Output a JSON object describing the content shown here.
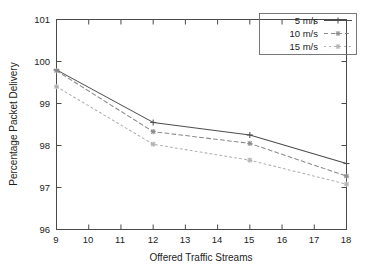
{
  "chart_data": {
    "type": "line",
    "title": "",
    "xlabel": "Offered Traffic Streams",
    "ylabel": "Percentage Packet Delivery",
    "x": [
      9,
      12,
      15,
      18
    ],
    "xlim": [
      9,
      18
    ],
    "ylim": [
      96,
      101
    ],
    "xticks": [
      "9",
      "10",
      "11",
      "12",
      "13",
      "14",
      "15",
      "16",
      "17",
      "18"
    ],
    "yticks": [
      "96",
      "97",
      "98",
      "99",
      "100",
      "101"
    ],
    "grid": false,
    "legend_position": "top-right",
    "series": [
      {
        "name": "5 m/s",
        "values": [
          99.8,
          98.55,
          98.25,
          97.57
        ],
        "color": "#4d4d4d",
        "dash": "none",
        "marker": "plus"
      },
      {
        "name": "10 m/s",
        "values": [
          99.78,
          98.33,
          98.05,
          97.27
        ],
        "color": "#8a8a8a",
        "dash": "4,3",
        "marker": "star"
      },
      {
        "name": "15 m/s",
        "values": [
          99.4,
          98.03,
          97.65,
          97.08
        ],
        "color": "#b0b0b0",
        "dash": "2,3",
        "marker": "star"
      }
    ]
  },
  "legend": {
    "items": [
      {
        "label": "5 m/s"
      },
      {
        "label": "10 m/s"
      },
      {
        "label": "15 m/s"
      }
    ]
  },
  "axes": {
    "x_title": "Offered Traffic Streams",
    "y_title": "Percentage Packet Delivery",
    "x_tick_labels": [
      "9",
      "10",
      "11",
      "12",
      "13",
      "14",
      "15",
      "16",
      "17",
      "18"
    ],
    "y_tick_labels": [
      "96",
      "97",
      "98",
      "99",
      "100",
      "101"
    ]
  }
}
